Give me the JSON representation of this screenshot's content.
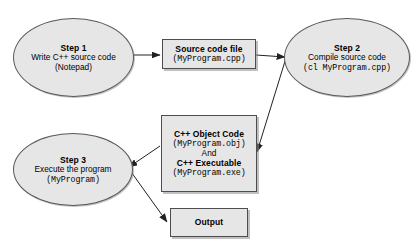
{
  "diagram": {
    "background_color": "#ffffff",
    "node_fill_color": "#e6e6e6",
    "node_border_color": "#4d4d4d",
    "edge_color": "#333333",
    "nodes": {
      "step1": {
        "shape": "ellipse",
        "title": "Step 1",
        "line2": "Write C++ source code",
        "line3": "(Notepad)"
      },
      "source_file": {
        "shape": "rectangle",
        "title": "Source code file",
        "line2": "(MyProgram.cpp)"
      },
      "step2": {
        "shape": "ellipse",
        "title": "Step 2",
        "line2": "Compile source code",
        "line3": "(cl MyProgram.cpp)"
      },
      "object_exec": {
        "shape": "rectangle",
        "line1": "C++ Object Code",
        "line2": "(MyProgram.obj)",
        "line3": "And",
        "line4": "C++ Executable",
        "line5": "(MyProgram.exe)"
      },
      "step3": {
        "shape": "ellipse",
        "title": "Step 3",
        "line2": "Execute the program",
        "line3": "(MyProgram)"
      },
      "output": {
        "shape": "rectangle",
        "title": "Output"
      }
    },
    "edges": [
      {
        "name": "step1-to-source-file",
        "from": "step1",
        "to": "source_file",
        "style": "arrow"
      },
      {
        "name": "source-file-to-step2",
        "from": "source_file",
        "to": "step2",
        "style": "arrow"
      },
      {
        "name": "step2-to-object-exec",
        "from": "step2",
        "to": "object_exec",
        "style": "arrow"
      },
      {
        "name": "object-exec-to-step3",
        "from": "object_exec",
        "to": "step3",
        "style": "arrow"
      },
      {
        "name": "step3-to-output",
        "from": "step3",
        "to": "output",
        "style": "arrow"
      }
    ]
  }
}
